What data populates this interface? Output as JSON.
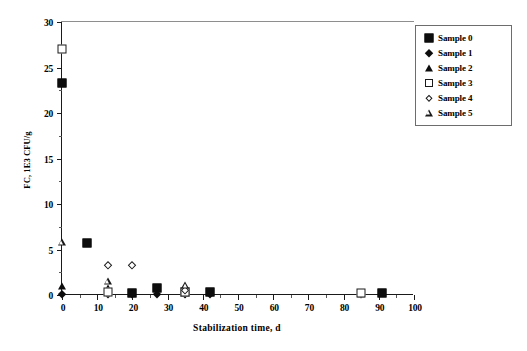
{
  "chart_data": {
    "type": "scatter",
    "title": "",
    "xlabel": "Stabilization time, d",
    "ylabel": "FC, 1E3 CFU/g",
    "xlim": [
      0,
      100
    ],
    "ylim": [
      0,
      30
    ],
    "xticks": [
      0,
      10,
      20,
      30,
      40,
      50,
      60,
      70,
      80,
      90,
      100
    ],
    "yticks": [
      0,
      5,
      10,
      15,
      20,
      25,
      30
    ],
    "xtick_labels": [
      "0",
      "10",
      "20",
      "30",
      "40",
      "50",
      "60",
      "70",
      "80",
      "90",
      "100"
    ],
    "ytick_labels": [
      "0",
      "5",
      "10",
      "15",
      "20",
      "25",
      "30"
    ],
    "grid": false,
    "legend_position": "top-right",
    "series": [
      {
        "name": "Sample 0",
        "marker": "filled-square",
        "points": [
          {
            "x": 0,
            "y": 23.3
          },
          {
            "x": 7,
            "y": 5.7
          },
          {
            "x": 20,
            "y": 0.25
          },
          {
            "x": 27,
            "y": 0.75
          },
          {
            "x": 35,
            "y": 0.3
          },
          {
            "x": 42,
            "y": 0.3
          },
          {
            "x": 91,
            "y": 0.2
          }
        ]
      },
      {
        "name": "Sample 1",
        "marker": "filled-diamond",
        "points": [
          {
            "x": 0,
            "y": 0.15
          },
          {
            "x": 13,
            "y": 0.1
          },
          {
            "x": 20,
            "y": 0.1
          },
          {
            "x": 27,
            "y": 0.1
          },
          {
            "x": 35,
            "y": 0.1
          },
          {
            "x": 42,
            "y": 0.1
          },
          {
            "x": 85,
            "y": 0.1
          }
        ]
      },
      {
        "name": "Sample 2",
        "marker": "filled-triangle",
        "points": [
          {
            "x": 0,
            "y": 1.0
          },
          {
            "x": 13,
            "y": 0.8
          },
          {
            "x": 20,
            "y": 0.2
          },
          {
            "x": 35,
            "y": 0.25
          },
          {
            "x": 85,
            "y": 0.15
          }
        ]
      },
      {
        "name": "Sample 3",
        "marker": "open-square",
        "points": [
          {
            "x": 0,
            "y": 27.0
          },
          {
            "x": 13,
            "y": 0.35
          },
          {
            "x": 35,
            "y": 0.35
          },
          {
            "x": 85,
            "y": 0.2
          }
        ]
      },
      {
        "name": "Sample 4",
        "marker": "open-diamond",
        "points": [
          {
            "x": 13,
            "y": 3.3
          },
          {
            "x": 20,
            "y": 3.3
          },
          {
            "x": 35,
            "y": 0.5
          }
        ]
      },
      {
        "name": "Sample 5",
        "marker": "open-triangle",
        "points": [
          {
            "x": 0,
            "y": 5.8
          },
          {
            "x": 13,
            "y": 1.5
          },
          {
            "x": 35,
            "y": 1.1
          }
        ]
      }
    ],
    "legend": [
      {
        "label": "Sample 0",
        "marker": "filled-square"
      },
      {
        "label": "Sample 1",
        "marker": "filled-diamond"
      },
      {
        "label": "Sample 2",
        "marker": "filled-triangle"
      },
      {
        "label": "Sample 3",
        "marker": "open-square"
      },
      {
        "label": "Sample 4",
        "marker": "open-diamond"
      },
      {
        "label": "Sample 5",
        "marker": "open-triangle"
      }
    ]
  }
}
